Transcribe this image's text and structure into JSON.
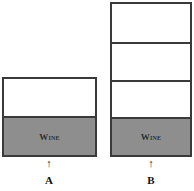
{
  "diagram": {
    "containers": [
      {
        "id": "A",
        "label": "A",
        "arrow": "↑",
        "segments": [
          {
            "type": "empty"
          },
          {
            "type": "wine",
            "text": "Wine"
          }
        ]
      },
      {
        "id": "B",
        "label": "B",
        "arrow": "↑",
        "segments": [
          {
            "type": "empty"
          },
          {
            "type": "empty"
          },
          {
            "type": "empty"
          },
          {
            "type": "wine",
            "text": "Wine"
          }
        ]
      }
    ],
    "colors": {
      "outline": "#3a3a3a",
      "wine_fill": "#8e8e8e",
      "background": "#ffffff"
    }
  }
}
